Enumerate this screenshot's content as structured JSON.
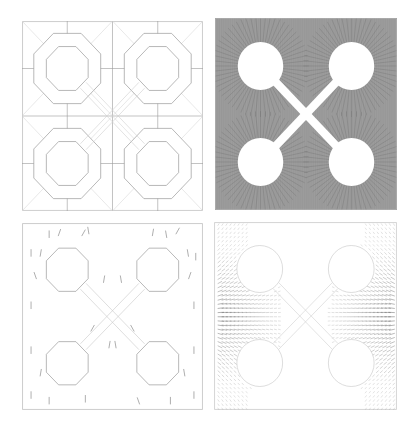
{
  "figure": {
    "panels": [
      {
        "id": "mesh",
        "label": "",
        "kind": "coarse-mesh",
        "octagon_sides": 8
      },
      {
        "id": "field",
        "label": "",
        "kind": "field-lines"
      },
      {
        "id": "vec",
        "label": "",
        "kind": "sparse-vector-field"
      },
      {
        "id": "dense",
        "label": "",
        "kind": "dense-vector-field"
      }
    ],
    "geometry": {
      "holes_centers_frac": [
        [
          0.25,
          0.25
        ],
        [
          0.75,
          0.25
        ],
        [
          0.25,
          0.75
        ],
        [
          0.75,
          0.75
        ]
      ],
      "hole_radius_frac": 0.125,
      "ring_radius_frac": 0.2,
      "connector": "x-shaped slots joining hole centers through panel center"
    },
    "colors": {
      "line": "#9a9a9a",
      "line_dark": "#555555",
      "field_fill": "#8a8a8a",
      "background": "#ffffff"
    }
  }
}
